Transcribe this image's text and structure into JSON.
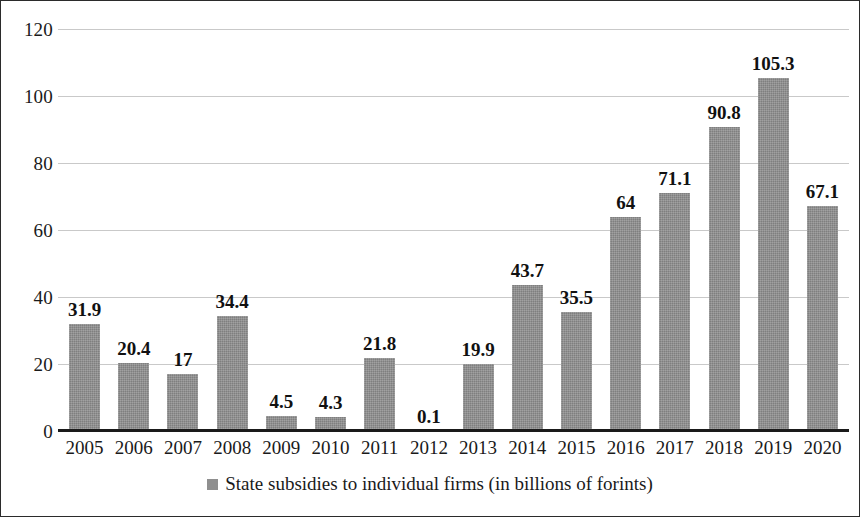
{
  "chart_data": {
    "type": "bar",
    "title": "",
    "subtitle": "",
    "xlabel": "",
    "ylabel": "",
    "categories": [
      "2005",
      "2006",
      "2007",
      "2008",
      "2009",
      "2010",
      "2011",
      "2012",
      "2013",
      "2014",
      "2015",
      "2016",
      "2017",
      "2018",
      "2019",
      "2020"
    ],
    "values": [
      31.9,
      20.4,
      17,
      34.4,
      4.5,
      4.3,
      21.8,
      0.1,
      19.9,
      43.7,
      35.5,
      64,
      71.1,
      90.8,
      105.3,
      67.1
    ],
    "value_labels": [
      "31.9",
      "20.4",
      "17",
      "34.4",
      "4.5",
      "4.3",
      "21.8",
      "0.1",
      "19.9",
      "43.7",
      "35.5",
      "64",
      "71.1",
      "90.8",
      "105.3",
      "67.1"
    ],
    "series": [
      {
        "name": "State subsidies to individual firms (in billions of forints)",
        "values": [
          31.9,
          20.4,
          17,
          34.4,
          4.5,
          4.3,
          21.8,
          0.1,
          19.9,
          43.7,
          35.5,
          64,
          71.1,
          90.8,
          105.3,
          67.1
        ],
        "color": "#8c8c8c"
      }
    ],
    "ylim": [
      0,
      120
    ],
    "yticks": [
      0,
      20,
      40,
      60,
      80,
      100,
      120
    ],
    "ytick_labels": [
      "0",
      "20",
      "40",
      "60",
      "80",
      "100",
      "120"
    ],
    "grid": true,
    "grid_axis": "y",
    "legend": {
      "position": "bottom",
      "entries": [
        {
          "label": "State subsidies to individual firms (in billions of forints)",
          "marker": "square",
          "color": "#8c8c8c"
        }
      ]
    },
    "colors": {
      "bar": "#8c8c8c",
      "gridline": "#c9c9c9",
      "axis": "#1a1a1a",
      "text": "#1a1a1a",
      "border": "#2b2b2b",
      "background": "#ffffff"
    }
  }
}
